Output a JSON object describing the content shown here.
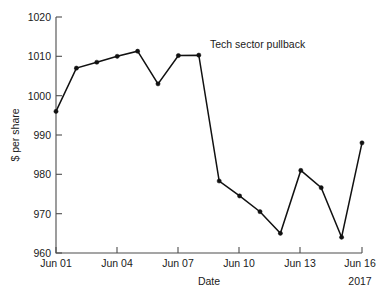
{
  "chart_data": {
    "type": "line",
    "title": "",
    "subtitle": "",
    "xlabel": "Date",
    "ylabel": "$ per share",
    "xlim": [
      "Jun 01",
      "Jun 16"
    ],
    "ylim": [
      960,
      1020
    ],
    "yticks": [
      960,
      970,
      980,
      990,
      1000,
      1010,
      1020
    ],
    "ytick_labels": [
      "960",
      "970",
      "980",
      "990",
      "1000",
      "1010",
      "1020"
    ],
    "xticks": [
      "Jun 01",
      "Jun 04",
      "Jun 07",
      "Jun 10",
      "Jun 13",
      "Jun 16"
    ],
    "xtick_labels": [
      "Jun 01",
      "Jun 04",
      "Jun 07",
      "Jun 10",
      "Jun 13",
      "Jun 16"
    ],
    "x_axis_year_label": "2017",
    "grid": false,
    "legend": null,
    "legend_position": "none",
    "marker": "filled-circle",
    "line_color": "#111111",
    "marker_color": "#111111",
    "axis_color": "#4d4d4d",
    "background_color": "#ffffff",
    "x": [
      "Jun 01",
      "Jun 02",
      "Jun 03",
      "Jun 04",
      "Jun 05",
      "Jun 06",
      "Jun 07",
      "Jun 08",
      "Jun 09",
      "Jun 10",
      "Jun 11",
      "Jun 12",
      "Jun 13",
      "Jun 14",
      "Jun 15",
      "Jun 16"
    ],
    "values": [
      996.0,
      1007.0,
      1008.5,
      1010.0,
      1011.3,
      1003.0,
      1010.2,
      1010.3,
      978.3,
      974.5,
      970.5,
      965.0,
      981.0,
      976.6,
      964.0,
      988.0
    ],
    "annotations": [
      {
        "text": "Tech sector pullback",
        "x": "Jun 08",
        "y": 1012.5
      }
    ]
  },
  "axis": {
    "ylabel": "$ per share",
    "xlabel": "Date",
    "year": "2017"
  }
}
